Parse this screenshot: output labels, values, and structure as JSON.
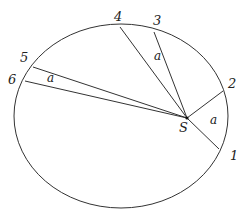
{
  "diagram": {
    "type": "kepler-second-law-orbit",
    "colors": {
      "stroke": "#333333",
      "background": "#ffffff"
    },
    "focus": {
      "label": "S",
      "x": 187,
      "y": 118
    },
    "orbit": {
      "cx": 121,
      "cy": 116,
      "rx": 107,
      "ry": 92
    },
    "points": [
      {
        "label": "1",
        "x": 219,
        "y": 149,
        "lx": 230,
        "ly": 160
      },
      {
        "label": "2",
        "x": 223,
        "y": 91,
        "lx": 228,
        "ly": 88
      },
      {
        "label": "3",
        "x": 154,
        "y": 32,
        "lx": 153,
        "ly": 25
      },
      {
        "label": "4",
        "x": 120,
        "y": 27,
        "lx": 114,
        "ly": 21
      },
      {
        "label": "5",
        "x": 33,
        "y": 67,
        "lx": 20,
        "ly": 62
      },
      {
        "label": "6",
        "x": 25,
        "y": 81,
        "lx": 8,
        "ly": 84
      }
    ],
    "sectors": [
      {
        "label": "a",
        "x": 210,
        "y": 124,
        "between": [
          "1",
          "2"
        ]
      },
      {
        "label": "a",
        "x": 154,
        "y": 60,
        "between": [
          "3",
          "4"
        ]
      },
      {
        "label": "a",
        "x": 47,
        "y": 82,
        "between": [
          "5",
          "6"
        ]
      }
    ]
  }
}
